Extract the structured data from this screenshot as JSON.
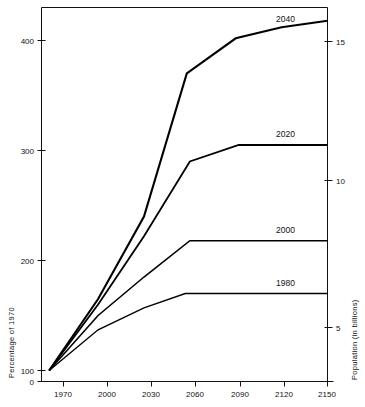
{
  "chart_data": {
    "type": "line",
    "title": "",
    "xlabel": "",
    "ylabel": "Percentage of 1970",
    "y2label": "Population (in billions)",
    "x": [
      1970,
      2000,
      2030,
      2060,
      2090,
      2120,
      2150
    ],
    "xlim": [
      1963,
      2150
    ],
    "ylim": [
      0,
      425
    ],
    "y2lim": [
      3.3,
      15.5
    ],
    "grid": false,
    "legend_position": "inline-right-of-each-line",
    "xticks": [
      "1970",
      "2000",
      "2030",
      "2060",
      "2090",
      "2120",
      "2150"
    ],
    "yticks": [
      "0",
      "100",
      "200",
      "300",
      "400"
    ],
    "y2ticks": [
      "5",
      "10",
      "15"
    ],
    "series": [
      {
        "name": "1980",
        "label": "1980",
        "x": [
          1968,
          2000,
          2030,
          2057,
          2090,
          2120,
          2150
        ],
        "values": [
          100,
          137,
          157,
          170,
          170,
          170,
          170
        ]
      },
      {
        "name": "2000",
        "label": "2000",
        "x": [
          1968,
          2000,
          2030,
          2060,
          2090,
          2120,
          2150
        ],
        "values": [
          100,
          150,
          185,
          218,
          218,
          218,
          218
        ]
      },
      {
        "name": "2020",
        "label": "2020",
        "x": [
          1968,
          2000,
          2030,
          2060,
          2092,
          2120,
          2150
        ],
        "values": [
          100,
          160,
          222,
          290,
          305,
          305,
          305
        ]
      },
      {
        "name": "2040",
        "label": "2040",
        "x": [
          1968,
          2000,
          2030,
          2058,
          2090,
          2120,
          2150
        ],
        "values": [
          100,
          165,
          240,
          370,
          402,
          412,
          418
        ]
      }
    ]
  },
  "axes": {
    "left_title": "Percentage of 1970",
    "right_title": "Population (in billions)",
    "x_tick_labels": [
      "1970",
      "2000",
      "2030",
      "2060",
      "2090",
      "2120",
      "2150"
    ],
    "left_tick_labels": [
      "400",
      "300",
      "200",
      "100",
      "0"
    ],
    "right_tick_labels": [
      "15",
      "10",
      "5"
    ]
  },
  "labels": {
    "s2040": "2040",
    "s2020": "2020",
    "s2000": "2000",
    "s1980": "1980"
  },
  "colors": {
    "ink": "#111111",
    "background": "#ffffff",
    "line": "#000000"
  }
}
